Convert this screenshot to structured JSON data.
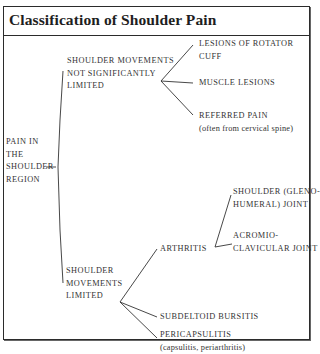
{
  "title": "Classification of Shoulder Pain",
  "root": {
    "label_lines": [
      "PAIN IN",
      "THE",
      "SHOULDER",
      "REGION"
    ]
  },
  "branches": [
    {
      "label_lines": [
        "SHOULDER MOVEMENTS",
        "NOT SIGNIFICANTLY",
        "LIMITED"
      ],
      "children": [
        {
          "label_lines": [
            "LESIONS OF ROTATOR",
            "CUFF"
          ]
        },
        {
          "label_lines": [
            "MUSCLE LESIONS"
          ]
        },
        {
          "label_lines": [
            "REFERRED PAIN"
          ],
          "note": "(often from cervical spine)"
        }
      ]
    },
    {
      "label_lines": [
        "SHOULDER",
        "MOVEMENTS",
        "LIMITED"
      ],
      "children": [
        {
          "label_lines": [
            "ARTHRITIS"
          ],
          "children": [
            {
              "label_lines": [
                "SHOULDER (GLENO-",
                "HUMERAL) JOINT"
              ]
            },
            {
              "label_lines": [
                "ACROMIO-",
                "CLAVICULAR JOINT"
              ]
            }
          ]
        },
        {
          "label_lines": [
            "SUBDELTOID BURSITIS"
          ]
        },
        {
          "label_lines": [
            "PERICAPSULITIS"
          ],
          "note": "(capsulitis, periarthritis)"
        }
      ]
    }
  ],
  "colors": {
    "line": "#333333",
    "text": "#333333",
    "border": "#2b2b2b",
    "background": "#ffffff"
  }
}
